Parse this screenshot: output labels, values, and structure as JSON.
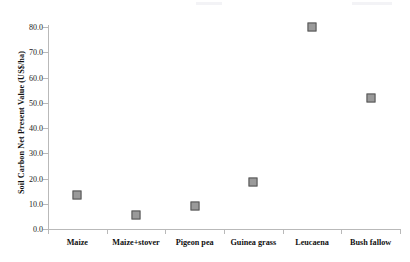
{
  "chart_data": {
    "type": "scatter",
    "title": "",
    "xlabel": "",
    "ylabel": "Soil Carbon Net Present Value (US$/ha)",
    "categories": [
      "Maize",
      "Maize+stover",
      "Pigeon pea",
      "Guinea grass",
      "Leucaena",
      "Bush fallow"
    ],
    "values": [
      13.5,
      5.5,
      9.0,
      18.5,
      80.0,
      52.0
    ],
    "ylim": [
      0,
      80
    ],
    "ytick_labels": [
      "0.0",
      "10.0",
      "20.0",
      "30.0",
      "40.0",
      "50.0",
      "60.0",
      "70.0",
      "80.0"
    ],
    "ytick_values": [
      0,
      10,
      20,
      30,
      40,
      50,
      60,
      70,
      80
    ],
    "grid": false,
    "legend": false,
    "marker": {
      "shape": "square",
      "fill_color": "#9a9a9a",
      "edge_color": "#555555"
    },
    "axis_color": "#b9b9b9"
  }
}
